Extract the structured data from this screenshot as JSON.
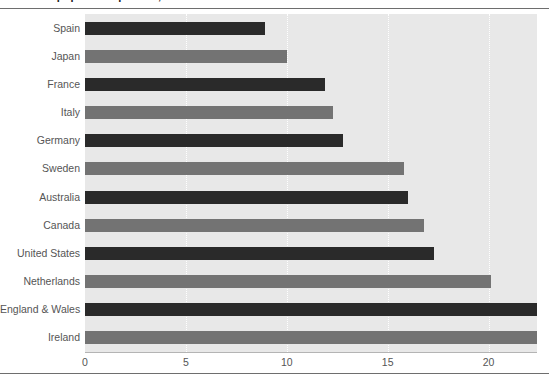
{
  "figure": {
    "title_cropped": "Prison population per 100,000",
    "plot_background": "#e8e8e8",
    "gridline_color": "#ffffff",
    "axis_label_color": "#555555"
  },
  "chart_data": {
    "type": "bar",
    "orientation": "horizontal",
    "title": "",
    "xlabel": "",
    "ylabel": "",
    "xlim": [
      0,
      22.4
    ],
    "xticks": [
      0,
      5,
      10,
      15,
      20
    ],
    "xtick_labels": [
      "0",
      "5",
      "10",
      "15",
      "20"
    ],
    "grid": true,
    "grid_axis": "x",
    "legend": null,
    "categories": [
      "Spain",
      "Japan",
      "France",
      "Italy",
      "Germany",
      "Sweden",
      "Australia",
      "Canada",
      "United States",
      "Netherlands",
      "England & Wales",
      "Ireland"
    ],
    "values": [
      8.9,
      10.0,
      11.9,
      12.3,
      12.8,
      15.8,
      16.0,
      16.8,
      17.3,
      20.1,
      22.4,
      22.4
    ],
    "bar_colors": [
      "#2a2a2a",
      "#737373",
      "#2a2a2a",
      "#737373",
      "#2a2a2a",
      "#737373",
      "#2a2a2a",
      "#737373",
      "#2a2a2a",
      "#737373",
      "#2a2a2a",
      "#737373"
    ]
  }
}
